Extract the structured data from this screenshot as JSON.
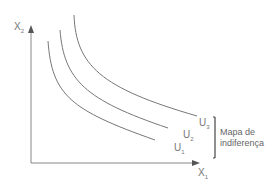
{
  "diagram": {
    "title": "Mapa de indiferença",
    "axes": {
      "y": {
        "label": "X",
        "subscript": "2"
      },
      "x": {
        "label": "X",
        "subscript": "1"
      }
    },
    "curves": [
      {
        "label": "U",
        "subscript": "1"
      },
      {
        "label": "U",
        "subscript": "2"
      },
      {
        "label": "U",
        "subscript": "3"
      }
    ],
    "bracket_label_line1": "Mapa de",
    "bracket_label_line2": "indiferença",
    "colors": {
      "axis": "#777777",
      "curve": "#666666",
      "text": "#777777"
    }
  }
}
